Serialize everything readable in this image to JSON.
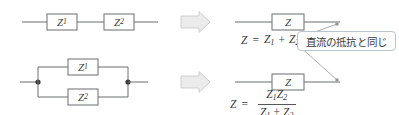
{
  "figure": {
    "background_color": "#ffffff",
    "line_color": "#6b6c70",
    "component_fill": "#ffffff",
    "arrow_fill": "#ebebeb",
    "arrow_stroke": "#c9c9c9",
    "callout_border": "#b9c4cc",
    "text_color": "#3a3a3a"
  },
  "rows": [
    {
      "id": "series",
      "left_circuit": {
        "topology": "series",
        "components": [
          {
            "label_base": "Z",
            "label_sub": "1"
          },
          {
            "label_base": "Z",
            "label_sub": "2"
          }
        ]
      },
      "arrow": {
        "name": "right-block-arrow",
        "direction": "right"
      },
      "right_circuit": {
        "topology": "single",
        "components": [
          {
            "label_base": "Z",
            "label_sub": ""
          }
        ]
      },
      "equation": {
        "lhs": "Z",
        "equals": "=",
        "kind": "sum",
        "terms": [
          {
            "base": "Z",
            "sub": "1"
          },
          {
            "base": "Z",
            "sub": "2"
          }
        ],
        "operator": "+",
        "plain": "Z = Z1 + Z2"
      }
    },
    {
      "id": "parallel",
      "left_circuit": {
        "topology": "parallel",
        "components": [
          {
            "label_base": "Z",
            "label_sub": "1"
          },
          {
            "label_base": "Z",
            "label_sub": "2"
          }
        ],
        "junction_nodes": 2
      },
      "arrow": {
        "name": "right-block-arrow",
        "direction": "right"
      },
      "right_circuit": {
        "topology": "single",
        "components": [
          {
            "label_base": "Z",
            "label_sub": ""
          }
        ]
      },
      "equation": {
        "lhs": "Z",
        "equals": "=",
        "kind": "fraction",
        "numerator": [
          {
            "base": "Z",
            "sub": "1"
          },
          {
            "base": "Z",
            "sub": "2"
          }
        ],
        "denominator": [
          {
            "base": "Z",
            "sub": "1"
          },
          {
            "base": "Z",
            "sub": "2"
          }
        ],
        "denominator_operator": "+",
        "plain": "Z = Z1 Z2 / (Z1 + Z2)"
      }
    }
  ],
  "callout": {
    "text": "直流の抵抗と同じ",
    "leader_count": 2
  }
}
